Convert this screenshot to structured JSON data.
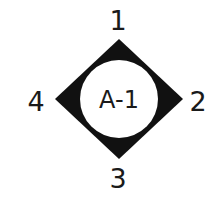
{
  "diagram": {
    "center_label": "A-1",
    "points": [
      {
        "id": "top",
        "label": "1"
      },
      {
        "id": "right",
        "label": "2"
      },
      {
        "id": "bottom",
        "label": "3"
      },
      {
        "id": "left",
        "label": "4"
      }
    ],
    "colors": {
      "diamond": "#111111",
      "circle": "#ffffff",
      "text": "#1a1a1a",
      "background": "#ffffff"
    }
  }
}
